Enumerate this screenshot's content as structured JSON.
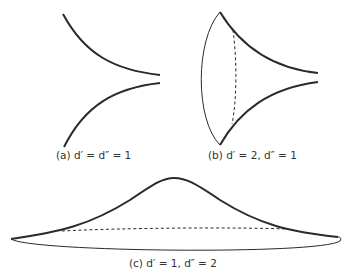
{
  "figures": [
    {
      "id": "a",
      "caption": "(a) d′ = d″ = 1"
    },
    {
      "id": "b",
      "caption": "(b) d′ = 2, d″ = 1"
    },
    {
      "id": "c",
      "caption": "(c) d′ = 1, d″ = 2"
    }
  ],
  "colors": {
    "stroke": "#2a2a2a",
    "background": "#ffffff"
  }
}
